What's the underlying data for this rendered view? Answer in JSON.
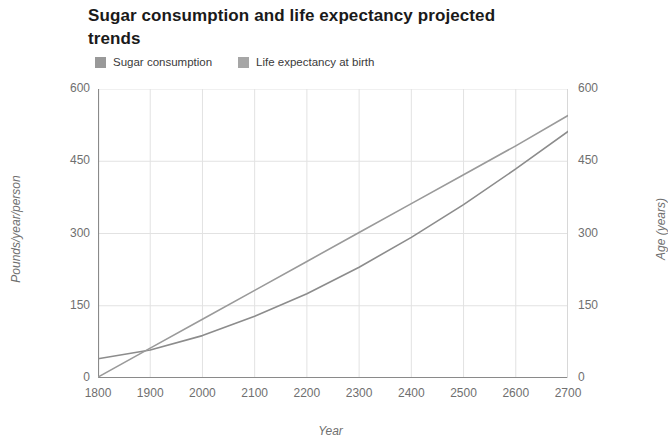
{
  "chart_data": {
    "type": "line",
    "title": "Sugar consumption and life expectancy projected trends",
    "xlabel": "Year",
    "ylabel": "Pounds/year/person",
    "y2label": "Age (years)",
    "xlim": [
      1800,
      2700
    ],
    "ylim": [
      0,
      600
    ],
    "y2lim": [
      0,
      600
    ],
    "grid": true,
    "legend_position": "top-left",
    "xticks": [
      "1800",
      "1900",
      "2000",
      "2100",
      "2200",
      "2300",
      "2400",
      "2500",
      "2600",
      "2700"
    ],
    "yticks": [
      "0",
      "150",
      "300",
      "450",
      "600"
    ],
    "y2ticks": [
      "0",
      "150",
      "300",
      "450",
      "600"
    ],
    "x": [
      1800,
      1900,
      2000,
      2100,
      2200,
      2300,
      2400,
      2500,
      2600,
      2700
    ],
    "series": [
      {
        "name": "Sugar consumption",
        "axis": "left",
        "color": "#8c8c8c",
        "values": [
          40,
          58,
          88,
          128,
          175,
          230,
          292,
          360,
          434,
          512
        ]
      },
      {
        "name": "Life expectancy at birth",
        "axis": "right",
        "color": "#9a9a9a",
        "values": [
          2,
          62,
          122,
          182,
          242,
          302,
          362,
          422,
          482,
          545
        ]
      }
    ],
    "annotations": [
      "Lines cross near year 1880 at about 45 units",
      "Lines cross again near year 2630 at about 455 units"
    ]
  },
  "legend": {
    "items": [
      {
        "label": "Sugar consumption",
        "swatch_color": "#999999"
      },
      {
        "label": "Life expectancy at birth",
        "swatch_color": "#a6a6a6"
      }
    ]
  }
}
